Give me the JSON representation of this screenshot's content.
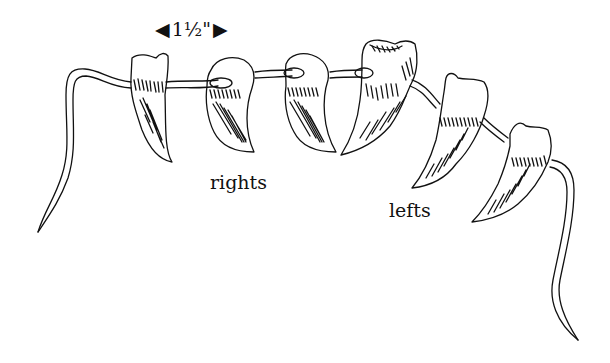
{
  "figure": {
    "measurement": {
      "left_arrow": "◀",
      "value": "1½\"",
      "right_arrow": "▶"
    },
    "labels": {
      "rights": "rights",
      "lefts": "lefts"
    },
    "claws": [
      {
        "group": "right",
        "index": 1
      },
      {
        "group": "right",
        "index": 2
      },
      {
        "group": "right",
        "index": 3
      },
      {
        "group": "left",
        "index": 1
      },
      {
        "group": "left",
        "index": 2
      },
      {
        "group": "left",
        "index": 3
      }
    ],
    "stroke_color": "#111111",
    "background_color": "#ffffff"
  }
}
